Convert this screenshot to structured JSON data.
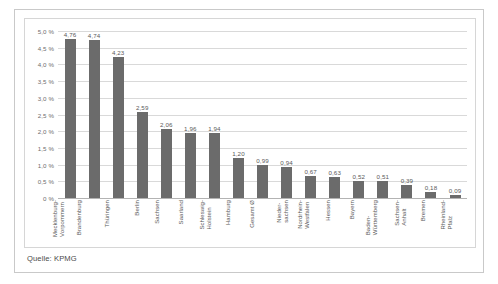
{
  "figure": {
    "caption": "Quelle: KPMG",
    "bar_color": "#6b6b6b",
    "grid_color": "#d9d9d9",
    "axis_color": "#b3b3b3",
    "frame_color": "#c9c9c9"
  },
  "chart_data": {
    "type": "bar",
    "title": "",
    "subtitle": "",
    "xlabel": "",
    "ylabel": "",
    "ylim": [
      0,
      5.0
    ],
    "grid": true,
    "legend": "none",
    "source": "Quelle: KPMG",
    "value_format": "german-decimal-comma",
    "ytick_labels": [
      "5,0 %",
      "4,5 %",
      "4,0 %",
      "3,5 %",
      "3,0 %",
      "2,5 %",
      "2,0 %",
      "1,5 %",
      "1,0 %",
      "0,5 %",
      "0 %"
    ],
    "ytick_values": [
      5.0,
      4.5,
      4.0,
      3.5,
      3.0,
      2.5,
      2.0,
      1.5,
      1.0,
      0.5,
      0
    ],
    "categories": [
      "Mecklenburg-Vorpommern",
      "Brandenburg",
      "Thüringen",
      "Berlin",
      "Sachsen",
      "Saarland",
      "Schleswig-Holstein",
      "Hamburg",
      "Gesamt Ø",
      "Niedersachsen",
      "Nordrhein-Westfalen",
      "Hessen",
      "Bayern",
      "Baden-Württemberg",
      "Sachsen-Anhalt",
      "Bremen",
      "Rheinland-Pfalz"
    ],
    "category_lines": [
      [
        "Mecklenburg-",
        "Vorpommern"
      ],
      [
        "Brandenburg"
      ],
      [
        "Thüringen"
      ],
      [
        "Berlin"
      ],
      [
        "Sachsen"
      ],
      [
        "Saarland"
      ],
      [
        "Schleswig-",
        "Holstein"
      ],
      [
        "Hamburg"
      ],
      [
        "Gesamt Ø"
      ],
      [
        "Nieder-",
        "sachsen"
      ],
      [
        "Nordrhein-",
        "Westfalen"
      ],
      [
        "Hessen"
      ],
      [
        "Bayern"
      ],
      [
        "Baden-",
        "Württemberg"
      ],
      [
        "Sachsen-",
        "Anhalt"
      ],
      [
        "Bremen"
      ],
      [
        "Rheinland-",
        "Pfalz"
      ]
    ],
    "values": [
      4.76,
      4.74,
      4.23,
      2.59,
      2.06,
      1.96,
      1.94,
      1.2,
      0.99,
      0.94,
      0.67,
      0.63,
      0.52,
      0.51,
      0.39,
      0.18,
      0.09
    ],
    "value_labels": [
      "4,76",
      "4,74",
      "4,23",
      "2,59",
      "2,06",
      "1,96",
      "1,94",
      "1,20",
      "0,99",
      "0,94",
      "0,67",
      "0,63",
      "0,52",
      "0,51",
      "0,39",
      "0,18",
      "0,09"
    ]
  }
}
